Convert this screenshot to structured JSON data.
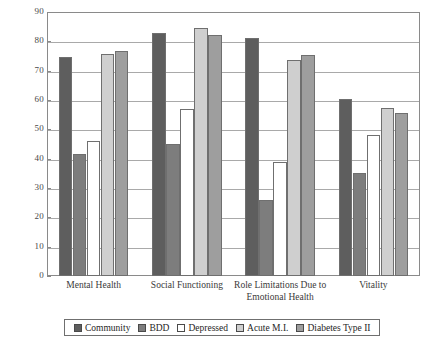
{
  "chart_data": {
    "type": "bar",
    "title": "",
    "subtitle": "",
    "xlabel": "",
    "ylabel": "",
    "ylim": [
      0,
      90
    ],
    "yticks": [
      0,
      10,
      20,
      30,
      40,
      50,
      60,
      70,
      80,
      90
    ],
    "grid": true,
    "legend_position": "bottom",
    "categories": [
      "Mental Health",
      "Social Functioning",
      "Role Limitations Due to Emotional Health",
      "Vitality"
    ],
    "category_lines": [
      [
        "Mental Health"
      ],
      [
        "Social Functioning"
      ],
      [
        "Role Limitations Due to",
        "Emotional Health"
      ],
      [
        "Vitality"
      ]
    ],
    "series": [
      {
        "name": "Community",
        "color": "#5e5e5e",
        "values": [
          74.5,
          83.0,
          81.0,
          60.5
        ]
      },
      {
        "name": "BDD",
        "color": "#7d7d7d",
        "values": [
          41.5,
          45.0,
          26.0,
          35.0
        ]
      },
      {
        "name": "Depressed",
        "color": "#ffffff",
        "values": [
          46.0,
          57.0,
          39.0,
          48.0
        ]
      },
      {
        "name": "Acute M.I.",
        "color": "#cfcfcf",
        "values": [
          75.7,
          84.5,
          73.5,
          57.3
        ]
      },
      {
        "name": "Diabetes Type II",
        "color": "#9e9e9e",
        "values": [
          76.6,
          82.0,
          75.5,
          55.5
        ]
      }
    ]
  },
  "legend": {
    "items": [
      {
        "label": "Community",
        "swatch": "#5e5e5e"
      },
      {
        "label": "BDD",
        "swatch": "#7d7d7d"
      },
      {
        "label": "Depressed",
        "swatch": "#ffffff"
      },
      {
        "label": "Acute M.I.",
        "swatch": "#cfcfcf"
      },
      {
        "label": "Diabetes Type II",
        "swatch": "#9e9e9e"
      }
    ]
  }
}
